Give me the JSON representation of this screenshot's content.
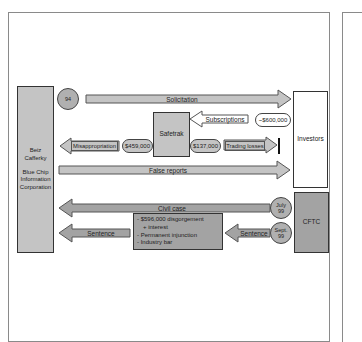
{
  "diagram": {
    "entities": {
      "company": {
        "lines": [
          "Beiz",
          "Cafferky",
          "",
          "Blue Chip",
          "Information",
          "Corporation"
        ]
      },
      "investors": {
        "label": "Investors"
      },
      "safetrak": {
        "label": "Safetrak"
      },
      "cftc": {
        "label": "CFTC"
      }
    },
    "events": {
      "year_94": "94",
      "july_99": [
        "July",
        "99"
      ],
      "sept_99": [
        "Sept.",
        "99"
      ]
    },
    "flows": {
      "solicitation": "Solicitation",
      "subscriptions": "Subscriptions",
      "subscriptions_amount": "~$600,000",
      "misappropriation": "Misappropriation",
      "misappropriation_amount": "$459,000",
      "trading_amount": "$137,000",
      "trading_losses": "Trading losses",
      "false_reports": "False reports",
      "civil_case": "Civil case",
      "sentence_right": "Sentence",
      "sentence_left": "Sentence"
    },
    "penalties": [
      "- $596,000 disgorgement",
      "   + interest",
      "- Permanent injunction",
      "- Industry bar"
    ],
    "colors": {
      "light_gray": "#c4c4c4",
      "dark_gray": "#a3a3a3",
      "circle_gray": "#b0b0b0",
      "border": "#333333"
    }
  }
}
